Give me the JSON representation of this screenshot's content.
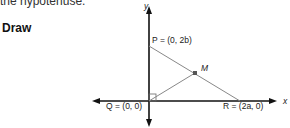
{
  "text": {
    "cut_off_line": "the hypotenuse.",
    "heading": "Draw"
  },
  "diagram": {
    "axes": {
      "x_label": "x",
      "y_label": "y"
    },
    "points": {
      "P": {
        "name": "P",
        "coords": "(0, 2b)",
        "label": "P = (0, 2b)"
      },
      "Q": {
        "name": "Q",
        "coords": "(0, 0)",
        "label": "Q = (0, 0)"
      },
      "R": {
        "name": "R",
        "coords": "(2a, 0)",
        "label": "R = (2a, 0)"
      },
      "M": {
        "name": "M",
        "label": "M",
        "description": "midpoint of hypotenuse PR"
      }
    },
    "segments": [
      "PR",
      "QM"
    ],
    "right_angle_at": "Q",
    "colors": {
      "axes": "#111111",
      "segments": "#888888",
      "point": "#555555"
    }
  }
}
